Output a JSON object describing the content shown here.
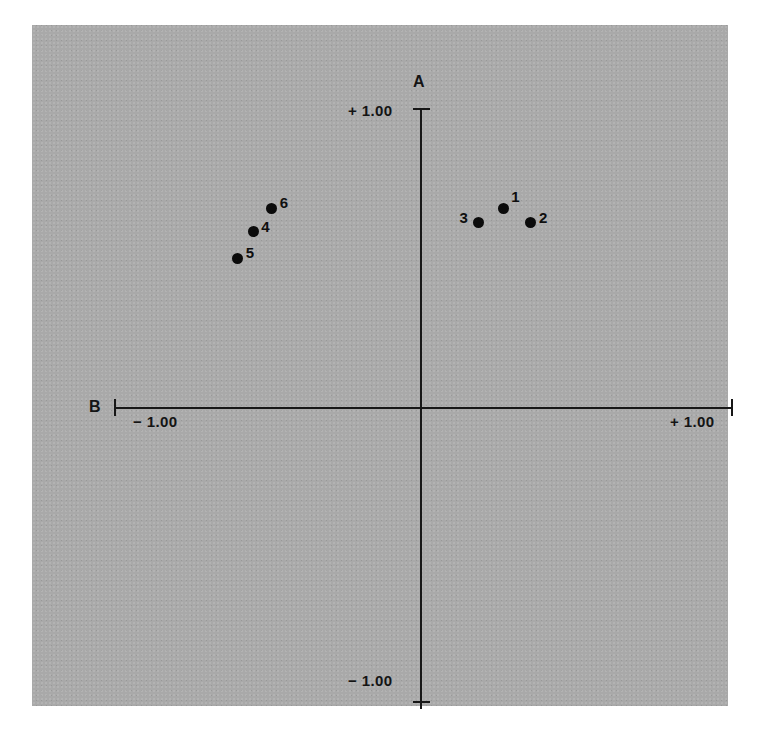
{
  "chart_data": {
    "type": "scatter",
    "title": "",
    "subtitle": "",
    "xlabel": "B",
    "ylabel": "A",
    "xlim": [
      -1.0,
      1.0
    ],
    "ylim": [
      -1.0,
      1.0
    ],
    "grid": false,
    "legend": "none",
    "axis_style": "crossed-axes-at-origin",
    "x_ticks": [
      {
        "value": -1.0,
        "label": "− 1.00"
      },
      {
        "value": 1.0,
        "label": "+ 1.00"
      }
    ],
    "y_ticks": [
      {
        "value": 1.0,
        "label": "+ 1.00"
      },
      {
        "value": -1.0,
        "label": "− 1.00"
      }
    ],
    "points": [
      {
        "label": "1",
        "x": 0.37,
        "y": 0.59,
        "label_pos": "ne"
      },
      {
        "label": "2",
        "x": 0.46,
        "y": 0.54,
        "label_pos": "right"
      },
      {
        "label": "3",
        "x": 0.29,
        "y": 0.54,
        "label_pos": "left"
      },
      {
        "label": "4",
        "x": -0.44,
        "y": 0.51,
        "label_pos": "right"
      },
      {
        "label": "5",
        "x": -0.49,
        "y": 0.42,
        "label_pos": "right"
      },
      {
        "label": "6",
        "x": -0.38,
        "y": 0.59,
        "label_pos": "right"
      }
    ],
    "colors": {
      "background": "#a9a9a9",
      "axis": "#171717",
      "point": "#0b0b0b",
      "text": "#141414"
    }
  },
  "axes": {
    "y_axis_name": "A",
    "x_axis_name": "B",
    "y_top_tick_label": "+ 1.00",
    "y_bottom_tick_label": "− 1.00",
    "x_left_tick_label": "− 1.00",
    "x_right_tick_label": "+ 1.00"
  },
  "points": {
    "p1": "1",
    "p2": "2",
    "p3": "3",
    "p4": "4",
    "p5": "5",
    "p6": "6"
  }
}
